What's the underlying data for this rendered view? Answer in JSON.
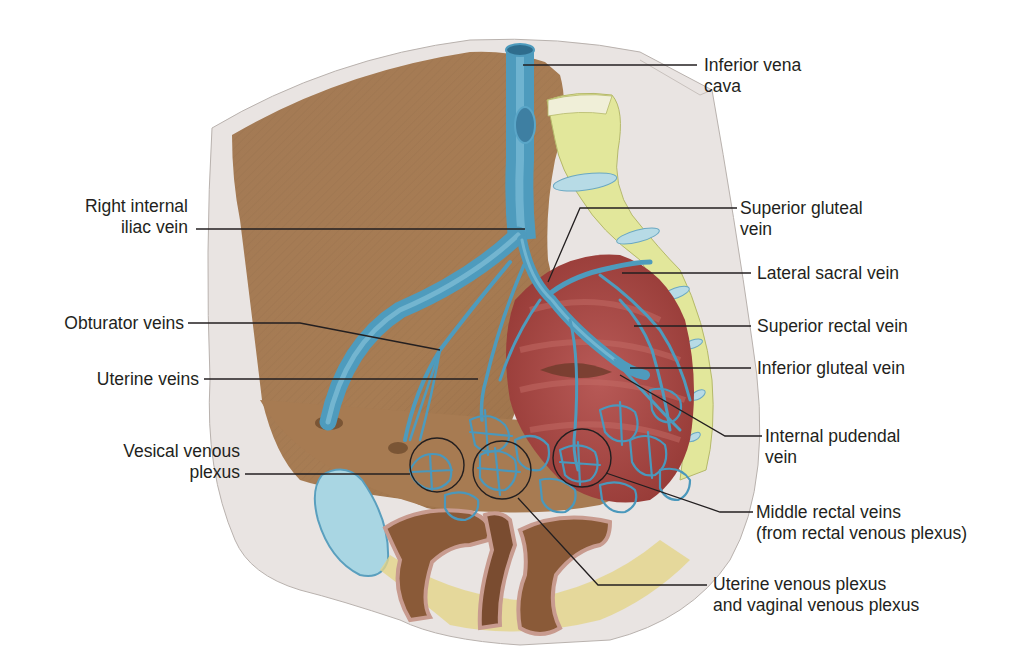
{
  "figure": {
    "colors": {
      "vein_blue": "#4e9bbd",
      "pelvic_wall_brown": "#a57a52",
      "muscle_red": "#a3443f",
      "sacrum_yellow": "#e3e89a",
      "cut_surface_gray": "#e8e3e1",
      "bladder_blue": "#a9d6e3"
    }
  },
  "labels": {
    "left": [
      {
        "id": "right-internal-iliac-vein",
        "lines": [
          "Right internal",
          "iliac vein"
        ]
      },
      {
        "id": "obturator-veins",
        "lines": [
          "Obturator veins"
        ]
      },
      {
        "id": "uterine-veins",
        "lines": [
          "Uterine veins"
        ]
      },
      {
        "id": "vesical-venous-plexus",
        "lines": [
          "Vesical venous",
          "plexus"
        ]
      }
    ],
    "right": [
      {
        "id": "inferior-vena-cava",
        "lines": [
          "Inferior vena",
          "cava"
        ]
      },
      {
        "id": "superior-gluteal-vein",
        "lines": [
          "Superior gluteal",
          "vein"
        ]
      },
      {
        "id": "lateral-sacral-vein",
        "lines": [
          "Lateral sacral vein"
        ]
      },
      {
        "id": "superior-rectal-vein",
        "lines": [
          "Superior rectal vein"
        ]
      },
      {
        "id": "inferior-gluteal-vein",
        "lines": [
          "Inferior gluteal vein"
        ]
      },
      {
        "id": "internal-pudendal-vein",
        "lines": [
          "Internal pudendal",
          "vein"
        ]
      },
      {
        "id": "middle-rectal-veins",
        "lines": [
          "Middle rectal veins",
          "(from rectal venous plexus)"
        ]
      },
      {
        "id": "uterine-vaginal-venous-plexus",
        "lines": [
          "Uterine venous plexus",
          "and vaginal venous plexus"
        ]
      }
    ]
  }
}
